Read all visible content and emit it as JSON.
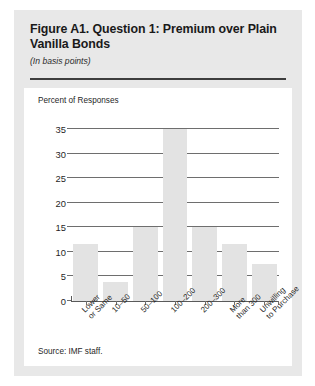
{
  "figure": {
    "title": "Figure A1. Question 1: Premium over Plain Vanilla Bonds",
    "subtitle": "(In basis points)",
    "source": "Source: IMF staff."
  },
  "chart_data": {
    "type": "bar",
    "title": "",
    "ylabel": "Percent of Responses",
    "xlabel": "",
    "categories": [
      "Lower\nor Same",
      "10–50",
      "50–100",
      "100–200",
      "200–300",
      "More\nthan 300",
      "Unwilling\nto Purchase"
    ],
    "values": [
      11.7,
      3.8,
      15.0,
      35.0,
      15.0,
      11.7,
      7.5
    ],
    "ylim": [
      0,
      35
    ],
    "yticks": [
      0,
      5,
      10,
      15,
      20,
      25,
      30,
      35
    ],
    "ytick_labels": [
      "0",
      "5",
      "10",
      "15",
      "20",
      "25",
      "30",
      "35"
    ],
    "grid": true,
    "legend": false,
    "bar_color": "#e3e3e3",
    "grid_color": "#6e6e6e"
  }
}
